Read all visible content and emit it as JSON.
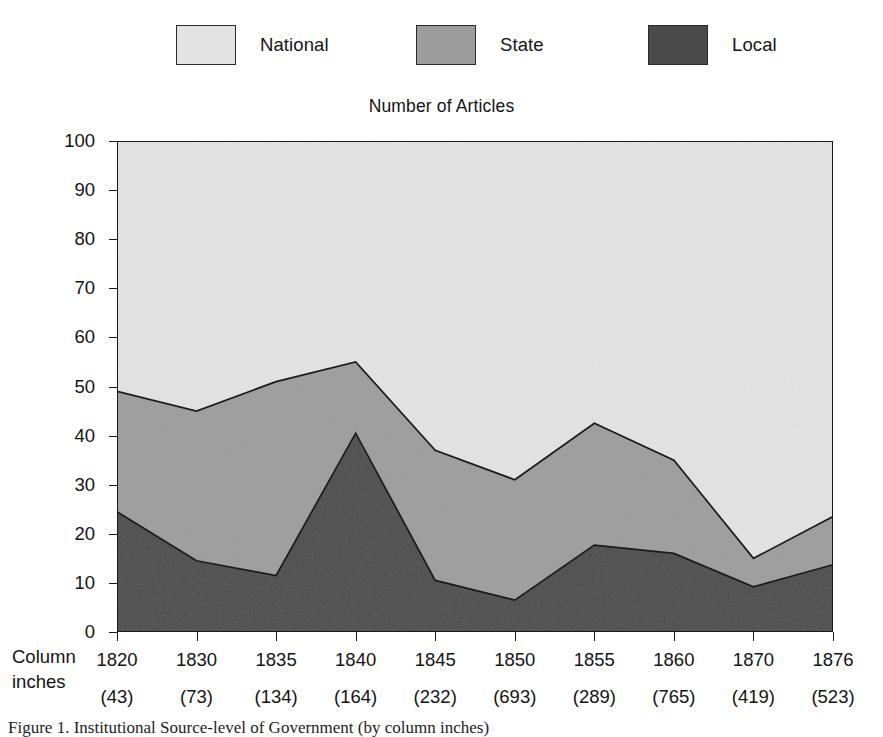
{
  "chart_data": {
    "type": "area",
    "stacked": true,
    "title": "Number of Articles",
    "xlabel": "",
    "ylabel": "Percent",
    "ylim": [
      0,
      100
    ],
    "ytick_step": 10,
    "yticks": [
      0,
      10,
      20,
      30,
      40,
      50,
      60,
      70,
      80,
      90,
      100
    ],
    "grid": false,
    "legend_position": "top",
    "categories": [
      "1820",
      "1830",
      "1835",
      "1840",
      "1845",
      "1850",
      "1855",
      "1860",
      "1870",
      "1876"
    ],
    "secondary_axis_label": "Column inches",
    "secondary_axis_values": [
      "(43)",
      "(73)",
      "(134)",
      "(164)",
      "(232)",
      "(693)",
      "(289)",
      "(765)",
      "(419)",
      "(523)"
    ],
    "column_inches": [
      43,
      73,
      134,
      164,
      232,
      693,
      289,
      765,
      419,
      523
    ],
    "stack_order_bottom_to_top": [
      "Local",
      "State",
      "National"
    ],
    "series": [
      {
        "name": "Local",
        "color": "#4a4a4a",
        "values": [
          24.5,
          14.5,
          11.5,
          40.5,
          10.5,
          6.5,
          17.7,
          16.0,
          9.2,
          13.7
        ]
      },
      {
        "name": "State",
        "color": "#9d9d9d",
        "values": [
          24.5,
          30.5,
          39.5,
          14.5,
          26.5,
          24.5,
          24.8,
          19.0,
          5.8,
          9.8
        ]
      },
      {
        "name": "National",
        "color": "#e3e3e3",
        "values": [
          51.0,
          55.0,
          49.0,
          45.0,
          63.0,
          69.0,
          57.5,
          65.0,
          85.0,
          76.5
        ]
      }
    ],
    "cumulative_upper_bounds": {
      "Local": [
        24.5,
        14.5,
        11.5,
        40.5,
        10.5,
        6.5,
        17.7,
        16.0,
        9.2,
        13.7
      ],
      "State": [
        49.0,
        45.0,
        51.0,
        55.0,
        37.0,
        31.0,
        42.5,
        35.0,
        15.0,
        23.5
      ],
      "National": [
        100,
        100,
        100,
        100,
        100,
        100,
        100,
        100,
        100,
        100
      ]
    }
  },
  "legend": {
    "items": [
      {
        "label": "National",
        "color": "#e3e3e3"
      },
      {
        "label": "State",
        "color": "#9d9d9d"
      },
      {
        "label": "Local",
        "color": "#4a4a4a"
      }
    ]
  },
  "axes": {
    "y_label": "Percent",
    "x_secondary_label_line1": "Column",
    "x_secondary_label_line2": "inches"
  },
  "caption": {
    "text": "Figure 1. Institutional Source-level of Government (by column inches)"
  },
  "colors": {
    "national": "#e3e3e3",
    "state": "#9d9d9d",
    "local": "#4a4a4a",
    "outline": "#1b1b1b",
    "background": "#ffffff"
  }
}
